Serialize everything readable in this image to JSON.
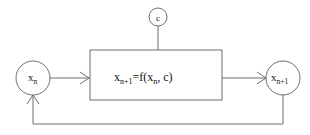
{
  "diagram": {
    "background_color": "#ffffff",
    "stroke_color": "#6e6e6e",
    "text_color": "#1a1a1a",
    "nodes": {
      "parameter": {
        "name": "parameter-node-c",
        "label": "c",
        "shape": "circle"
      },
      "input": {
        "name": "input-node-xn",
        "label_base": "x",
        "label_sub": "n",
        "shape": "circle"
      },
      "output": {
        "name": "output-node-xn1",
        "label_base": "x",
        "label_sub": "n+1",
        "shape": "circle"
      },
      "process": {
        "name": "process-block",
        "shape": "rectangle",
        "equation_lhs_base": "x",
        "equation_lhs_sub": "n+1",
        "equation_operator": "=",
        "equation_rhs_prefix": "f(x",
        "equation_rhs_sub": "n",
        "equation_rhs_suffix": ", c)"
      }
    },
    "connectors": [
      {
        "name": "connector-parameter-to-block",
        "from": "parameter-node-c",
        "to": "process-block",
        "arrowhead": false
      },
      {
        "name": "connector-input-to-block",
        "from": "input-node-xn",
        "to": "process-block",
        "arrowhead": true
      },
      {
        "name": "connector-block-to-output",
        "from": "process-block",
        "to": "output-node-xn1",
        "arrowhead": true
      },
      {
        "name": "connector-feedback-loop",
        "from": "output-node-xn1",
        "to": "input-node-xn",
        "arrowhead": true
      }
    ]
  }
}
